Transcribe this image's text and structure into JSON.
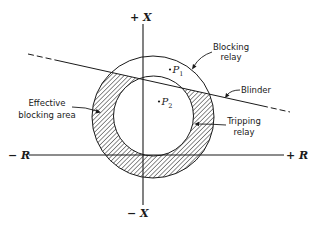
{
  "diagram": {
    "axes": {
      "pos_x": "+ X",
      "neg_x": "− X",
      "pos_r": "+ R",
      "neg_r": "− R"
    },
    "labels": {
      "blocking_relay": [
        "Blocking",
        "relay"
      ],
      "blinder": "Blinder",
      "effective_blocking_area": [
        "Effective",
        "blocking area"
      ],
      "tripping_relay": [
        "Tripping",
        "relay"
      ]
    },
    "points": [
      {
        "name": "P",
        "sub": "1"
      },
      {
        "name": "P",
        "sub": "2"
      }
    ],
    "colors": {
      "ink": "#1a1a1a",
      "background": "#ffffff"
    }
  }
}
